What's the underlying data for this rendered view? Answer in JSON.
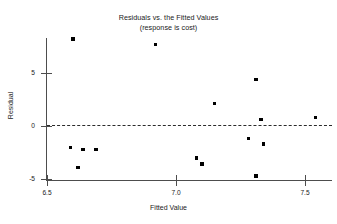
{
  "chart_data": {
    "type": "scatter",
    "title": "Residuals vs. the Fitted Values",
    "subtitle": "(response is cost)",
    "xlabel": "Fitted Value",
    "ylabel": "Residual",
    "xlim": [
      6.39,
      7.61
    ],
    "ylim": [
      -5.6,
      8.9
    ],
    "xticks": [
      6.5,
      7.0,
      7.5
    ],
    "xtick_labels": [
      "6.5",
      "7.0",
      "7.5"
    ],
    "yticks": [
      5,
      0,
      -5
    ],
    "ytick_labels": [
      "5",
      "0",
      "-5"
    ],
    "grid": false,
    "legend": null,
    "reference_line": {
      "orientation": "horizontal",
      "value": 0,
      "style": "dashed",
      "color": "#2b2b2b"
    },
    "marker": {
      "shape": "square",
      "color": "#000000",
      "size": 3.4
    },
    "points": [
      {
        "x": 6.6,
        "y": 8.2
      },
      {
        "x": 6.92,
        "y": 7.7
      },
      {
        "x": 7.31,
        "y": 4.4
      },
      {
        "x": 7.15,
        "y": 2.1
      },
      {
        "x": 7.54,
        "y": 0.8
      },
      {
        "x": 7.33,
        "y": 0.6
      },
      {
        "x": 7.28,
        "y": -1.2
      },
      {
        "x": 7.34,
        "y": -1.7
      },
      {
        "x": 6.59,
        "y": -2.0
      },
      {
        "x": 6.64,
        "y": -2.2
      },
      {
        "x": 6.69,
        "y": -2.2
      },
      {
        "x": 7.08,
        "y": -3.0
      },
      {
        "x": 7.1,
        "y": -3.6
      },
      {
        "x": 6.62,
        "y": -3.9
      },
      {
        "x": 7.31,
        "y": -4.7
      }
    ]
  }
}
